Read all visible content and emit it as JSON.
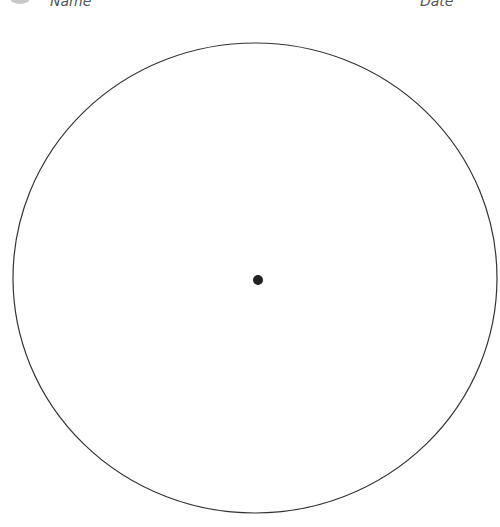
{
  "header": {
    "name_label": "Name",
    "date_label": "Date"
  },
  "worksheet": {
    "circle": {
      "cx": 255,
      "cy": 278,
      "rx": 242,
      "ry": 235,
      "stroke": "#333333",
      "stroke_width": 1.2
    },
    "center_point": {
      "cx": 258,
      "cy": 280,
      "r": 5,
      "fill": "#222222"
    }
  }
}
